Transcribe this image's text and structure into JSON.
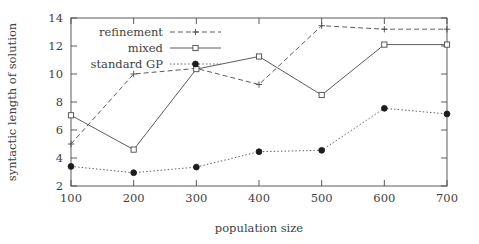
{
  "chart_data": {
    "type": "line",
    "title": "",
    "xlabel": "population size",
    "ylabel": "syntactic length of solution",
    "x": [
      100,
      200,
      300,
      400,
      500,
      600,
      700
    ],
    "xticklabels": [
      "100",
      "200",
      "300",
      "400",
      "500",
      "600",
      "700"
    ],
    "yticks": [
      2,
      4,
      6,
      8,
      10,
      12,
      14
    ],
    "yticklabels": [
      "2",
      "4",
      "6",
      "8",
      "10",
      "12",
      "14"
    ],
    "xlim": [
      100,
      700
    ],
    "ylim": [
      2,
      14
    ],
    "grid": false,
    "legend_position": "upper-left-inside",
    "series": [
      {
        "name": "refinement",
        "values": [
          5.0,
          10.0,
          10.4,
          9.25,
          13.45,
          13.2,
          13.2
        ],
        "linestyle": "dashed",
        "marker": "plus",
        "color": "#4a4a4a"
      },
      {
        "name": "mixed",
        "values": [
          7.05,
          4.6,
          10.35,
          11.25,
          8.5,
          12.1,
          12.1
        ],
        "linestyle": "solid",
        "marker": "open-square",
        "color": "#4a4a4a"
      },
      {
        "name": "standard GP",
        "values": [
          3.4,
          2.95,
          3.35,
          4.45,
          4.55,
          7.55,
          7.15
        ],
        "linestyle": "dotted",
        "marker": "filled-circle",
        "color": "#1d1d1d"
      }
    ]
  },
  "axes": {
    "y_label": "syntactic length of solution",
    "x_label": "population size"
  },
  "legend": {
    "entries": [
      {
        "label": "refinement"
      },
      {
        "label": "mixed"
      },
      {
        "label": "standard GP"
      }
    ]
  }
}
